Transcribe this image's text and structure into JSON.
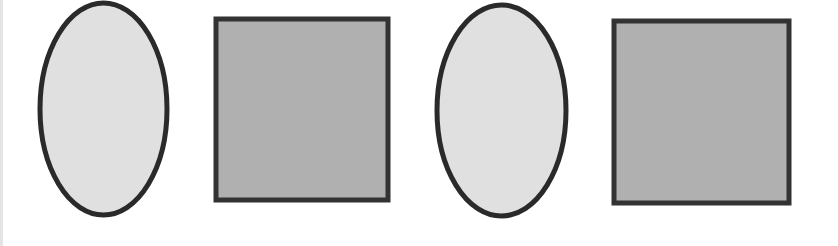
{
  "diagram": {
    "shapes": [
      {
        "type": "ellipse",
        "x": 40,
        "y": 3,
        "width": 127,
        "height": 212,
        "fill": "#e0e0e0",
        "stroke": "#2a2a2a",
        "stroke_width": 5
      },
      {
        "type": "rect",
        "x": 216,
        "y": 19,
        "width": 172,
        "height": 181,
        "fill": "#b0b0b0",
        "stroke": "#333333",
        "stroke_width": 5
      },
      {
        "type": "ellipse",
        "x": 437,
        "y": 5,
        "width": 129,
        "height": 211,
        "fill": "#e0e0e0",
        "stroke": "#2a2a2a",
        "stroke_width": 5
      },
      {
        "type": "rect",
        "x": 614,
        "y": 21,
        "width": 175,
        "height": 182,
        "fill": "#b0b0b0",
        "stroke": "#333333",
        "stroke_width": 5
      }
    ]
  }
}
